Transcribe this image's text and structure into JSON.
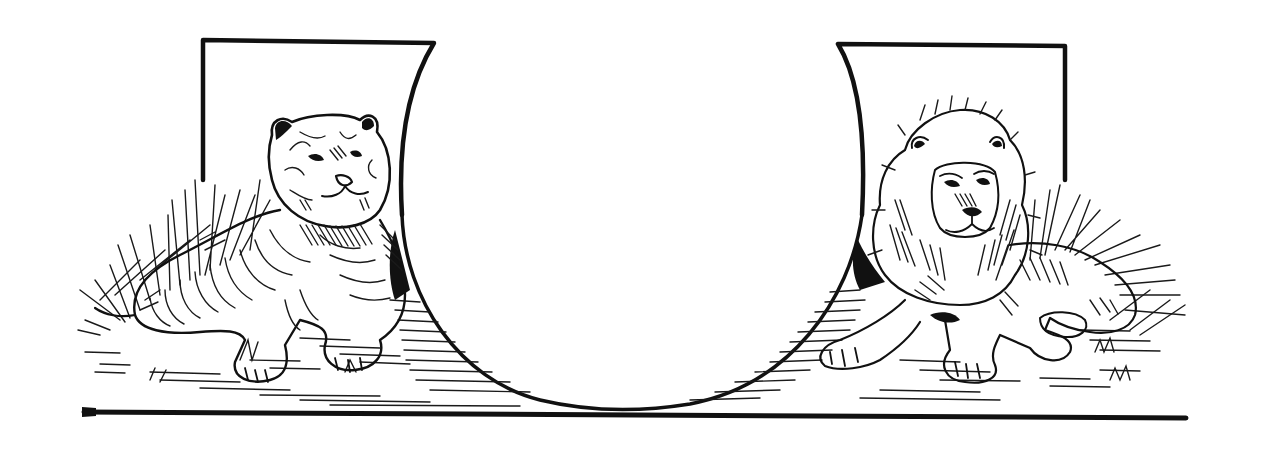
{
  "illustration": {
    "subject": "Decorative initial letter U with tiger and lion",
    "style": "black-and-white engraving",
    "colors": {
      "ink": "#111111",
      "paper": "#ffffff"
    },
    "letter": "U",
    "left_figure": "tiger",
    "right_figure": "lion"
  }
}
